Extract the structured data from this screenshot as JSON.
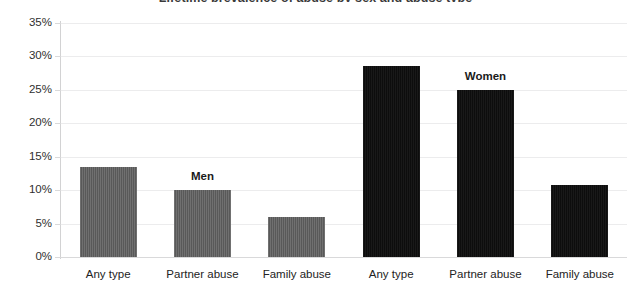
{
  "chart_data": {
    "type": "bar",
    "title": "Lifetime prevalence of abuse by sex and abuse type",
    "title_clipped": true,
    "subtitle": "",
    "xlabel": "",
    "ylabel": "",
    "ylim": [
      0,
      35
    ],
    "ytick_step": 5,
    "ytick_labels": [
      "0%",
      "5%",
      "10%",
      "15%",
      "20%",
      "25%",
      "30%",
      "35%"
    ],
    "ytick_values": [
      0,
      5,
      10,
      15,
      20,
      25,
      30,
      35
    ],
    "grid": "horizontal",
    "legend_position": "inline-annotations",
    "value_suffix": "%",
    "categories": [
      "Any type",
      "Partner abuse",
      "Family abuse"
    ],
    "series": [
      {
        "name": "Men",
        "color": "#595959",
        "values": [
          13.5,
          10.0,
          6.0
        ],
        "annotation_over_category": "Partner abuse"
      },
      {
        "name": "Women",
        "color": "#0d0d0d",
        "values": [
          28.5,
          25.0,
          10.8
        ],
        "annotation_over_category": "Partner abuse"
      }
    ],
    "bars": [
      {
        "label": "Any type",
        "series": "Men",
        "value": 13.5,
        "color": "#595959"
      },
      {
        "label": "Partner abuse",
        "series": "Men",
        "value": 10.0,
        "color": "#595959"
      },
      {
        "label": "Family abuse",
        "series": "Men",
        "value": 6.0,
        "color": "#595959"
      },
      {
        "label": "Any type",
        "series": "Women",
        "value": 28.5,
        "color": "#0d0d0d"
      },
      {
        "label": "Partner abuse",
        "series": "Women",
        "value": 25.0,
        "color": "#0d0d0d"
      },
      {
        "label": "Family abuse",
        "series": "Women",
        "value": 10.8,
        "color": "#0d0d0d"
      }
    ],
    "annotations": [
      {
        "text": "Men",
        "over_bar_index": 1
      },
      {
        "text": "Women",
        "over_bar_index": 4
      }
    ],
    "colors": {
      "men": "#595959",
      "women": "#0d0d0d",
      "gridline": "#ececed",
      "axis": "#d2d2d3",
      "tick_text": "#2f2f2f",
      "background": "#ffffff"
    }
  }
}
